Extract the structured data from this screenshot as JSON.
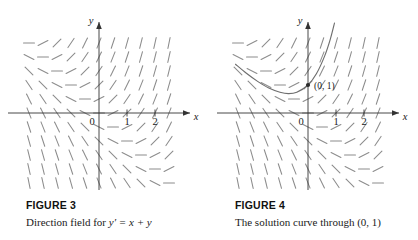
{
  "figures": [
    {
      "heading": "FIGURE 3",
      "caption_prefix": "Direction field for ",
      "caption_math": "y′ = x + y",
      "axis": {
        "x_label": "x",
        "y_label": "y"
      },
      "x_ticks": [
        "0",
        "1",
        "2"
      ],
      "point_label": "",
      "has_solution_curve": false
    },
    {
      "heading": "FIGURE 4",
      "caption_prefix": "The solution curve through ",
      "caption_math": "(0, 1)",
      "axis": {
        "x_label": "x",
        "y_label": "y"
      },
      "x_ticks": [
        "0",
        "1",
        "2"
      ],
      "point_label": "(0, 1)",
      "has_solution_curve": true
    }
  ],
  "chart_data": {
    "type": "line",
    "xlabel": "x",
    "ylabel": "y",
    "equation": "y' = x + y",
    "solution_equation": "y = 2e^x - x - 1",
    "initial_condition": {
      "x": 0,
      "y": 1
    },
    "xlim": [
      -3.0,
      2.9
    ],
    "ylim": [
      -2.9,
      2.9
    ],
    "x_tick_values": [
      0,
      1,
      2
    ],
    "y_tick_values": [],
    "grid": false,
    "legend": "none",
    "field_grid": {
      "x_values": [
        -2.5,
        -2.0,
        -1.5,
        -1.0,
        -0.5,
        0.0,
        0.5,
        1.0,
        1.5,
        2.0,
        2.5
      ],
      "y_values": [
        2.5,
        2.0,
        1.5,
        1.0,
        0.5,
        0.0,
        -0.5,
        -1.0,
        -1.5,
        -2.0,
        -2.5
      ],
      "slope_rule": "dy/dx = x + y",
      "segment_length_px": 11
    },
    "curve_points": [
      {
        "x": -2.6,
        "y": 1.75
      },
      {
        "x": -2.2,
        "y": 1.42
      },
      {
        "x": -1.8,
        "y": 1.13
      },
      {
        "x": -1.4,
        "y": 0.89
      },
      {
        "x": -1.0,
        "y": 0.74
      },
      {
        "x": -0.7,
        "y": 0.69
      },
      {
        "x": -0.4,
        "y": 0.74
      },
      {
        "x": 0.0,
        "y": 1.0
      },
      {
        "x": 0.3,
        "y": 1.4
      },
      {
        "x": 0.6,
        "y": 2.05
      },
      {
        "x": 0.8,
        "y": 2.65
      },
      {
        "x": 0.95,
        "y": 3.23
      }
    ],
    "annotations": [
      {
        "text": "(0, 1)",
        "x": 0,
        "y": 1
      }
    ]
  }
}
